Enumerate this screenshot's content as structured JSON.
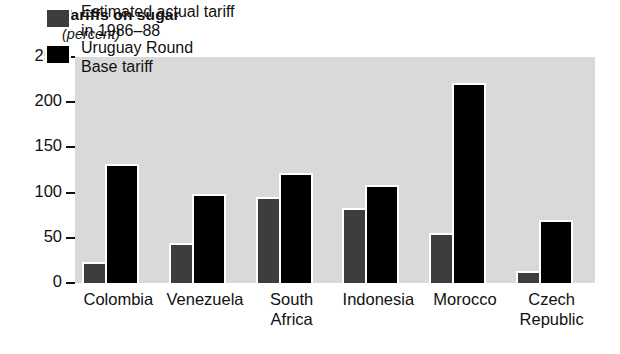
{
  "chart_data": {
    "type": "bar",
    "title": "Tariffs on sugar",
    "subtitle": "(percent)",
    "xlabel": "",
    "ylabel": "",
    "unit": "percent",
    "grid": false,
    "legend_position": "top-left inside plot",
    "ylim": [
      0,
      250
    ],
    "yticks": [
      0,
      50,
      100,
      150,
      200,
      250
    ],
    "ytick_labels": [
      "0",
      "50",
      "100",
      "150",
      "200",
      "250"
    ],
    "categories": [
      "Colombia",
      "Venezuela",
      "South\nAfrica",
      "Indonesia",
      "Morocco",
      "Czech\nRepublic"
    ],
    "series": [
      {
        "name": "Estimated actual tariff in 1986–88",
        "legend_line1": "Estimated actual tariff",
        "legend_line2": "in 1986–88",
        "color": "#3d3d3d",
        "values": [
          21,
          42,
          93,
          81,
          53,
          11
        ]
      },
      {
        "name": "Uruguay Round Base tariff",
        "legend_line1": "Uruguay Round",
        "legend_line2": "Base tariff",
        "color": "#000000",
        "values": [
          129,
          96,
          120,
          106,
          219,
          68
        ]
      }
    ]
  },
  "style": {
    "plot_background": "#d9d9d9",
    "page_background": "#ffffff",
    "text_color": "#111111"
  }
}
